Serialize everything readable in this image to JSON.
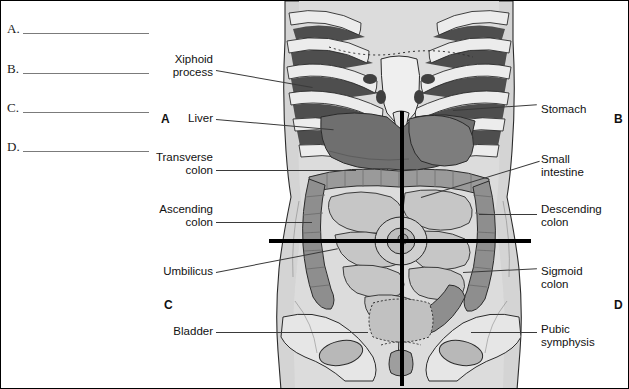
{
  "worksheet": {
    "blanks": [
      {
        "letter": "A."
      },
      {
        "letter": "B."
      },
      {
        "letter": "C."
      },
      {
        "letter": "D."
      }
    ]
  },
  "quadrants": [
    {
      "id": "quadrant-a",
      "label": "A"
    },
    {
      "id": "quadrant-b",
      "label": "B"
    },
    {
      "id": "quadrant-c",
      "label": "C"
    },
    {
      "id": "quadrant-d",
      "label": "D"
    }
  ],
  "labels_left": [
    {
      "id": "xiphoid-process",
      "text": "Xiphoid\nprocess"
    },
    {
      "id": "liver",
      "text": "Liver"
    },
    {
      "id": "transverse-colon",
      "text": "Transverse\ncolon"
    },
    {
      "id": "ascending-colon",
      "text": "Ascending\ncolon"
    },
    {
      "id": "umbilicus",
      "text": "Umbilicus"
    },
    {
      "id": "bladder",
      "text": "Bladder"
    }
  ],
  "labels_right": [
    {
      "id": "stomach",
      "text": "Stomach"
    },
    {
      "id": "small-intestine",
      "text": "Small\nintestine"
    },
    {
      "id": "descending-colon",
      "text": "Descending\ncolon"
    },
    {
      "id": "sigmoid-colon",
      "text": "Sigmoid\ncolon"
    },
    {
      "id": "pubic-symphysis",
      "text": "Pubic\nsymphysis"
    }
  ],
  "colors": {
    "skin": "#d2d2d2",
    "skin_light": "#dedede",
    "bone": "#e8e8e8",
    "intercostal": "#4a4a4a",
    "liver": "#6f6f6f",
    "colon": "#9a9a9a",
    "small_intestine": "#c4c4c4",
    "outline": "#2b2b2b",
    "plane": "#000000",
    "leader": "#3a3a3a"
  }
}
